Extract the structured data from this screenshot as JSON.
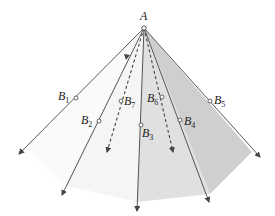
{
  "diagram": {
    "apex": {
      "label": "A",
      "x": 144,
      "y": 28
    },
    "colors": {
      "line": "#444444",
      "face_dark": "#cfcfcf",
      "face_mid": "#e0e0e0",
      "face_light": "#ececec",
      "face_lightest": "#f5f5f5"
    },
    "rays": [
      {
        "name": "B1",
        "label": "B",
        "sub": "1",
        "px": 76,
        "py": 98,
        "ex": 19,
        "ey": 154,
        "style": "solid",
        "lx": 58,
        "ly": 100
      },
      {
        "name": "B2",
        "label": "B",
        "sub": "2",
        "px": 99,
        "py": 121,
        "ex": 62,
        "ey": 195,
        "style": "solid",
        "lx": 81,
        "ly": 124
      },
      {
        "name": "B7",
        "label": "B",
        "sub": "7",
        "px": 121,
        "py": 101,
        "ex": 107,
        "ey": 152,
        "style": "dashed",
        "lx": 124,
        "ly": 105
      },
      {
        "name": "B3",
        "label": "B",
        "sub": "3",
        "px": 141,
        "py": 125,
        "ex": 137,
        "ey": 211,
        "style": "solid",
        "lx": 142,
        "ly": 137
      },
      {
        "name": "B6",
        "label": "B",
        "sub": "6",
        "px": 162,
        "py": 97,
        "ex": 173,
        "ey": 152,
        "style": "dashed",
        "lx": 147,
        "ly": 102
      },
      {
        "name": "B4",
        "label": "B",
        "sub": "4",
        "px": 180,
        "py": 120,
        "ex": 209,
        "ey": 202,
        "style": "solid",
        "lx": 184,
        "ly": 125
      },
      {
        "name": "B5",
        "label": "B",
        "sub": "5",
        "px": 210,
        "py": 101,
        "ex": 260,
        "ey": 157,
        "style": "solid",
        "lx": 214,
        "ly": 104
      }
    ],
    "base_polygon": [
      [
        64,
        185
      ],
      [
        137,
        202
      ],
      [
        210,
        194
      ],
      [
        252,
        152
      ]
    ]
  }
}
